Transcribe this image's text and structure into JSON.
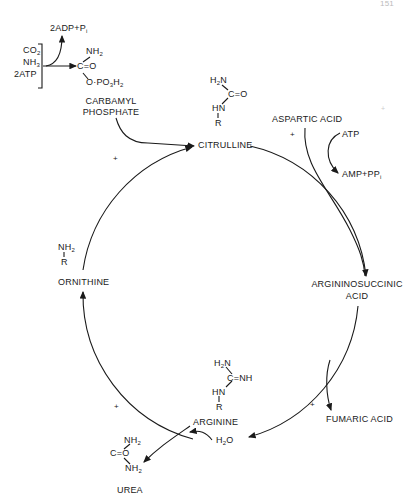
{
  "page_number": "151",
  "inputs": {
    "co2": "CO",
    "co2_sub": "2",
    "nh3": "NH",
    "nh3_sub": "3",
    "atp": "2ATP"
  },
  "byproduct_top": {
    "label": "2ADP+P",
    "sub": "i"
  },
  "carbamyl_phosphate": {
    "nh2": "NH",
    "nh2_sub": "2",
    "c_o": "C=O",
    "o_po3h2": "O·PO",
    "o_po3h2_sub1": "3",
    "o_po3h2_h": "H",
    "o_po3h2_sub2": "2",
    "name_line1": "CARBAMYL",
    "name_line2": "PHOSPHATE"
  },
  "citrulline": {
    "h2n": "H",
    "h2n_sub": "2",
    "h2n_n": "N",
    "c_o": "C=O",
    "hn": "HN",
    "r": "R",
    "name": "CITRULLINE"
  },
  "aspartic_acid": {
    "name": "ASPARTIC ACID"
  },
  "atp_side": {
    "atp": "ATP",
    "amp": "AMP+PP",
    "amp_sub": "i"
  },
  "argininosuccinic_acid": {
    "line1": "ARGININOSUCCINIC",
    "line2": "ACID"
  },
  "fumaric_acid": {
    "name": "FUMARIC ACID"
  },
  "arginine": {
    "h2n": "H",
    "h2n_sub": "2",
    "h2n_n": "N",
    "c_nh": "C=NH",
    "hn": "HN",
    "r": "R",
    "name": "ARGININE"
  },
  "water": {
    "label": "H",
    "sub": "2",
    "o": "O"
  },
  "urea": {
    "nh2_top": "NH",
    "nh2_top_sub": "2",
    "c_o": "C=O",
    "nh2_bot": "NH",
    "nh2_bot_sub": "2",
    "name": "UREA"
  },
  "ornithine": {
    "nh2": "NH",
    "nh2_sub": "2",
    "r": "R",
    "name": "ORNITHINE"
  },
  "plus_sign": "+",
  "colors": {
    "ink": "#1a1a1a",
    "background": "#ffffff"
  }
}
